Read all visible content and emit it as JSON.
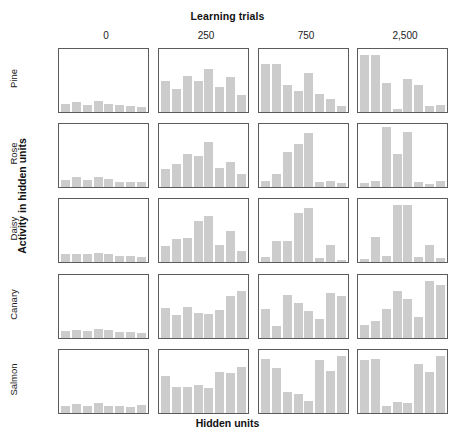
{
  "figure": {
    "top_title": "Learning trials",
    "x_axis_title": "Hidden units",
    "y_axis_title": "Activity in hidden units",
    "bar_color": "#cccccc",
    "panel_border_color": "#5b5b5b"
  },
  "columns": [
    {
      "label": "0"
    },
    {
      "label": "250"
    },
    {
      "label": "750"
    },
    {
      "label": "2,500"
    }
  ],
  "rows": [
    {
      "label": "Pine"
    },
    {
      "label": "Rose"
    },
    {
      "label": "Daisy"
    },
    {
      "label": "Canary"
    },
    {
      "label": "Salmon"
    }
  ],
  "chart_data": {
    "type": "bar",
    "title": "Learning trials",
    "xlabel": "Hidden units",
    "ylabel": "Activity in hidden units",
    "grid": false,
    "legend": "none",
    "ylim": [
      0,
      100
    ],
    "units_per_panel": 8,
    "categories": [
      "1",
      "2",
      "3",
      "4",
      "5",
      "6",
      "7",
      "8"
    ],
    "col_labels": [
      "0",
      "250",
      "750",
      "2,500"
    ],
    "row_labels": [
      "Pine",
      "Rose",
      "Daisy",
      "Canary",
      "Salmon"
    ],
    "panels": [
      {
        "row": "Pine",
        "col": "0",
        "values": [
          14,
          16,
          12,
          18,
          14,
          11,
          10,
          8
        ]
      },
      {
        "row": "Pine",
        "col": "250",
        "values": [
          52,
          38,
          60,
          52,
          72,
          42,
          58,
          28
        ]
      },
      {
        "row": "Pine",
        "col": "750",
        "values": [
          80,
          80,
          45,
          35,
          65,
          30,
          22,
          10
        ]
      },
      {
        "row": "Pine",
        "col": "2,500",
        "values": [
          95,
          95,
          48,
          5,
          55,
          45,
          10,
          12
        ]
      },
      {
        "row": "Rose",
        "col": "0",
        "values": [
          12,
          16,
          11,
          17,
          13,
          9,
          9,
          8
        ]
      },
      {
        "row": "Rose",
        "col": "250",
        "values": [
          30,
          38,
          55,
          52,
          75,
          32,
          42,
          22
        ]
      },
      {
        "row": "Rose",
        "col": "750",
        "values": [
          10,
          22,
          58,
          72,
          90,
          8,
          10,
          6
        ]
      },
      {
        "row": "Rose",
        "col": "2,500",
        "values": [
          6,
          10,
          100,
          55,
          92,
          8,
          5,
          10
        ]
      },
      {
        "row": "Daisy",
        "col": "0",
        "values": [
          13,
          14,
          13,
          15,
          13,
          10,
          10,
          9
        ]
      },
      {
        "row": "Daisy",
        "col": "250",
        "values": [
          26,
          38,
          40,
          68,
          76,
          28,
          52,
          18
        ]
      },
      {
        "row": "Daisy",
        "col": "750",
        "values": [
          8,
          35,
          35,
          82,
          90,
          6,
          28,
          4
        ]
      },
      {
        "row": "Daisy",
        "col": "2,500",
        "values": [
          5,
          42,
          10,
          95,
          95,
          8,
          28,
          6
        ]
      },
      {
        "row": "Canary",
        "col": "0",
        "values": [
          12,
          14,
          11,
          15,
          13,
          10,
          10,
          8
        ]
      },
      {
        "row": "Canary",
        "col": "250",
        "values": [
          50,
          38,
          52,
          42,
          40,
          46,
          70,
          78
        ]
      },
      {
        "row": "Canary",
        "col": "750",
        "values": [
          48,
          20,
          72,
          58,
          45,
          32,
          75,
          70
        ]
      },
      {
        "row": "Canary",
        "col": "2,500",
        "values": [
          22,
          28,
          48,
          78,
          65,
          35,
          95,
          88
        ]
      },
      {
        "row": "Salmon",
        "col": "0",
        "values": [
          12,
          15,
          12,
          16,
          12,
          11,
          10,
          13
        ]
      },
      {
        "row": "Salmon",
        "col": "250",
        "values": [
          62,
          44,
          44,
          46,
          42,
          68,
          66,
          76
        ]
      },
      {
        "row": "Salmon",
        "col": "750",
        "values": [
          90,
          75,
          35,
          32,
          20,
          88,
          70,
          95
        ]
      },
      {
        "row": "Salmon",
        "col": "2,500",
        "values": [
          88,
          90,
          12,
          18,
          16,
          82,
          68,
          95
        ]
      }
    ]
  }
}
